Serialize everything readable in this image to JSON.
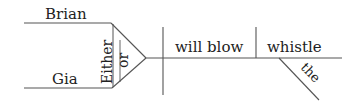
{
  "diagram": {
    "type": "sentence-diagram",
    "style": "Reed-Kellogg",
    "line_color": "#555555",
    "text_color": "#222222",
    "subjects": [
      {
        "word": "Brian"
      },
      {
        "word": "Gia"
      }
    ],
    "conjunction": {
      "first": "Either",
      "second": "or"
    },
    "verb": "will blow",
    "object": "whistle",
    "modifier": {
      "word": "the",
      "modifies": "whistle"
    }
  }
}
